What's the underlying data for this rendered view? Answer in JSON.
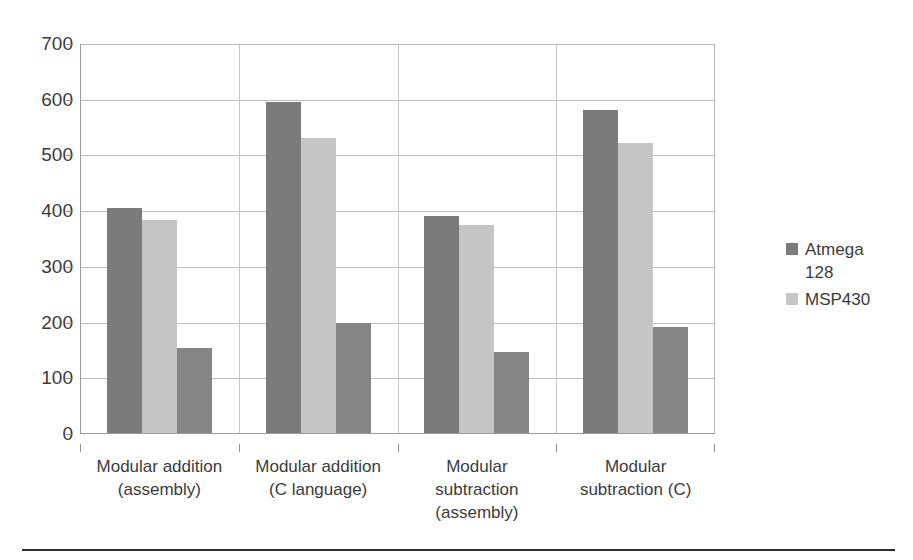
{
  "chart_data": {
    "type": "bar",
    "title": "",
    "xlabel": "",
    "ylabel": "",
    "ylim": [
      0,
      700
    ],
    "ytick_step": 100,
    "yticks": [
      "700",
      "600",
      "500",
      "400",
      "300",
      "200",
      "100",
      "0"
    ],
    "grid": true,
    "legend_position": "right",
    "categories": [
      "Modular addition (assembly)",
      "Modular addition (C language)",
      "Modular subtraction (assembly)",
      "Modular subtraction (C)"
    ],
    "category_lines": [
      [
        "Modular addition",
        "(assembly)"
      ],
      [
        "Modular addition",
        "(C language)"
      ],
      [
        "Modular",
        "subtraction",
        "(assembly)"
      ],
      [
        "Modular",
        "subtraction (C)"
      ]
    ],
    "series": [
      {
        "name": "Atmega 128",
        "color": "#7b7b7b",
        "values": [
          405,
          596,
          392,
          582
        ]
      },
      {
        "name": "MSP430",
        "color": "#c5c5c5",
        "values": [
          385,
          532,
          375,
          523
        ]
      },
      {
        "name": "",
        "color": "#858585",
        "values": [
          155,
          200,
          148,
          192
        ]
      }
    ]
  },
  "legend": {
    "entries": [
      {
        "label_line1": "Atmega",
        "label_line2": "128",
        "color": "#7b7b7b"
      },
      {
        "label_line1": "MSP430",
        "label_line2": "",
        "color": "#c5c5c5"
      }
    ]
  }
}
